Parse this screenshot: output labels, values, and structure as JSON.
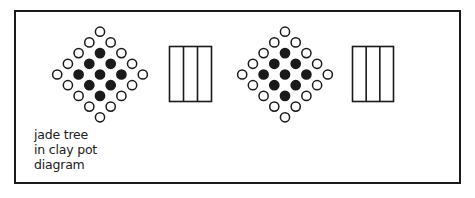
{
  "diagram": {
    "label_lines": [
      "jade tree",
      "in clay pot",
      "diagram"
    ],
    "colors": {
      "stroke": "#1a1a1a",
      "fill": "#1a1a1a",
      "background": "#ffffff"
    },
    "frame": {
      "x": 14,
      "y": 10,
      "w": 447,
      "h": 174
    },
    "dot_spacing": 10.7,
    "dot_radius": 4.6,
    "diamonds": [
      {
        "name": "plant-top-view-1",
        "cx": 100,
        "cy": 74.5
      },
      {
        "name": "plant-top-view-2",
        "cx": 285,
        "cy": 74.5
      }
    ],
    "diamond_rows": [
      [
        "o"
      ],
      [
        "o",
        "o"
      ],
      [
        "o",
        "f",
        "o"
      ],
      [
        "o",
        "f",
        "f",
        "o"
      ],
      [
        "o",
        "f",
        "f",
        "f",
        "o"
      ],
      [
        "o",
        "f",
        "f",
        "o"
      ],
      [
        "o",
        "f",
        "o"
      ],
      [
        "o",
        "o"
      ],
      [
        "o"
      ]
    ],
    "pots": [
      {
        "name": "pot-side-view-1",
        "x": 169.5,
        "y": 46.5,
        "w": 42,
        "h": 55,
        "columns": 3
      },
      {
        "name": "pot-side-view-2",
        "x": 352.5,
        "y": 46.5,
        "w": 41,
        "h": 55,
        "columns": 3
      }
    ]
  }
}
